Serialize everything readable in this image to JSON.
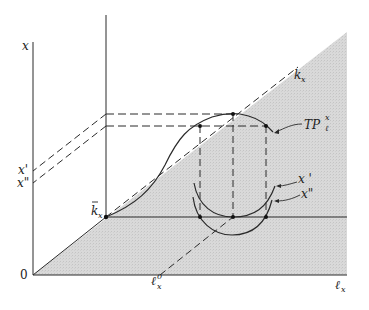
{
  "diagram": {
    "type": "economics production diagram (three-dimensional total product surface)",
    "colors": {
      "shade": "#d6d6d6",
      "line": "#2a2a2a",
      "background": "#ffffff"
    },
    "axes": {
      "vertical_outer_label": "x",
      "horizontal_label_main": "ℓ",
      "horizontal_label_sub": "x",
      "origin_label": "0",
      "depth_axis_label_main": "k",
      "depth_axis_label_sub": "x"
    },
    "labels": {
      "x_prime": "x'",
      "x_double_prime": "x\"",
      "k_bar_main": "k",
      "k_bar_sub": "x",
      "l_zero_main": "ℓ",
      "l_zero_sub": "x",
      "l_zero_sup": "0",
      "tp_main": "TP",
      "tp_sup": "x",
      "tp_sub": "ℓ",
      "isoquant_1": "x '",
      "isoquant_2": "x\""
    }
  }
}
